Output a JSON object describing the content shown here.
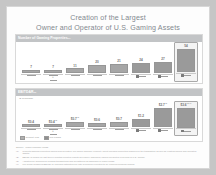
{
  "slide": {
    "title_line_1": "Creation of the Largest",
    "title_line_2": "Owner and Operator of U.S. Gaming Assets",
    "accent_color": "#83888f",
    "bar_color": "#a6a6a6",
    "header_band_color": "#c2c4c6"
  },
  "chart_data": [
    {
      "type": "bar",
      "title": "Number of Gaming Properties",
      "title_sup": "(1)",
      "subtitle": "",
      "xlabel": "",
      "ylabel": "",
      "categories": [
        "Boyd Gaming",
        "Penn National + Pinnacle",
        "Churchill Downs",
        "Eldorado Resorts",
        "Golden Entertainment",
        "Caesars",
        "MGM Resorts",
        "Pro Forma Company"
      ],
      "values": [
        7,
        7,
        11,
        20,
        21,
        24,
        27,
        54
      ],
      "value_labels": [
        "7",
        "7",
        "11",
        "20",
        "21",
        "24",
        "27",
        "54"
      ],
      "highlight_index": 7,
      "ylim": [
        0,
        60
      ],
      "grid": false,
      "legend_position": "none"
    },
    {
      "type": "bar",
      "title": "EBITDAR",
      "title_sup": "(2)",
      "subtitle": "($ in billions)",
      "xlabel": "",
      "ylabel": "",
      "categories": [
        "Boyd Gaming",
        "Penn National + Pinnacle",
        "Churchill Downs",
        "Eldorado Resorts",
        "Golden Entertainment",
        "Caesars",
        "MGM Resorts",
        "Pro Forma Company"
      ],
      "values": [
        0.4,
        0.4,
        0.7,
        0.6,
        0.7,
        1.2,
        2.7,
        3.6
      ],
      "value_labels": [
        "$0.4",
        "$0.4",
        "$0.7",
        "$0.6",
        "$0.7",
        "$1.2",
        "$2.7",
        "$3.6"
      ],
      "value_sups": [
        "",
        "(3)",
        "(3)",
        "",
        "",
        "",
        "(3)",
        "(3)(4)"
      ],
      "highlight_index": 7,
      "ylim": [
        0,
        4.0
      ],
      "grid": false,
      "legend_position": "bottom-left",
      "legend": [
        "Current Year",
        "Pro Forma"
      ]
    }
  ],
  "legend": {
    "item_1": "Current Year",
    "item_2": "Pro Forma"
  },
  "footnotes": {
    "source_marker": "Source:",
    "source_text": "Public company filings",
    "items": [
      {
        "marker": "(1)",
        "text": "Reflects gaming properties owned and operated. Pro forma company property count includes properties acquired in the transaction as well as existing owned and operated assets."
      },
      {
        "marker": "(2)",
        "text": "EBITDAR based on last twelve months reported results as publicly disclosed; figures presented in billions of U.S. dollars."
      },
      {
        "marker": "(3)",
        "text": "Adjusted for announced pending transactions and divestitures as disclosed in public filings."
      },
      {
        "marker": "(4)",
        "text": "Pro forma combined EBITDAR includes estimated run-rate synergies expected to be realized following closing."
      }
    ]
  }
}
